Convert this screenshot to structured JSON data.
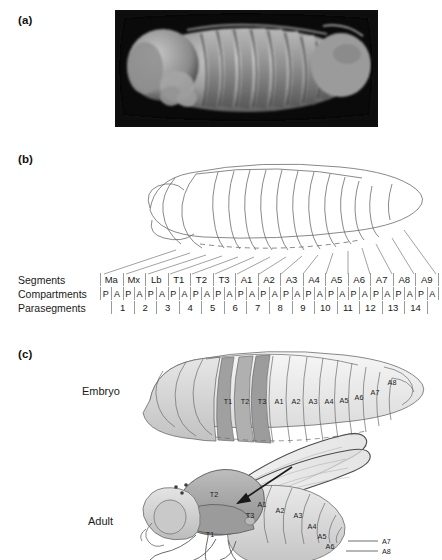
{
  "figure": {
    "panels": [
      {
        "id": "a",
        "label": "(a)",
        "kind": "sem-micrograph"
      },
      {
        "id": "b",
        "label": "(b)",
        "kind": "line-drawing-with-segment-table"
      },
      {
        "id": "c",
        "label": "(c)",
        "kind": "embryo-and-adult-comparison"
      }
    ]
  },
  "segment_table": {
    "row_labels": {
      "segments": "Segments",
      "compartments": "Compartments",
      "parasegments": "Parasegments"
    },
    "segments": [
      "Ma",
      "Mx",
      "Lb",
      "T1",
      "T2",
      "T3",
      "A1",
      "A2",
      "A3",
      "A4",
      "A5",
      "A6",
      "A7",
      "A8",
      "A9"
    ],
    "compartments": [
      "P",
      "A",
      "P",
      "A",
      "P",
      "A",
      "P",
      "A",
      "P",
      "A",
      "P",
      "A",
      "P",
      "A",
      "P",
      "A",
      "P",
      "A",
      "P",
      "A",
      "P",
      "A",
      "P",
      "A",
      "P",
      "A",
      "P",
      "A",
      "P",
      "A"
    ],
    "parasegments": [
      "1",
      "2",
      "3",
      "4",
      "5",
      "6",
      "7",
      "8",
      "9",
      "10",
      "11",
      "12",
      "13",
      "14"
    ]
  },
  "panel_c": {
    "embryo_label": "Embryo",
    "adult_label": "Adult",
    "embryo_segments": [
      "T1",
      "T2",
      "T3",
      "A1",
      "A2",
      "A3",
      "A4",
      "A5",
      "A6",
      "A7",
      "A8"
    ],
    "adult_segments": [
      "T1",
      "T2",
      "T3",
      "A1",
      "A2",
      "A3",
      "A4",
      "A5",
      "A6",
      "A7",
      "A8"
    ]
  },
  "colors": {
    "photo_background": "#0a0a0a",
    "outline": "#6b6b6b",
    "rule": "#9a9a9a",
    "text": "#1a1a1a",
    "thorax_shade": "#9e9e9e",
    "abdomen_shade": "#ededed",
    "head_shade": "#d8d8d8"
  }
}
